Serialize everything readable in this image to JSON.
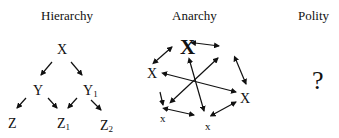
{
  "panels": [
    {
      "title": "Hierarchy",
      "nodes": {
        "x": "X",
        "y": "Y",
        "y1_base": "Y",
        "y1_sub": "1",
        "z": "Z",
        "z1_base": "Z",
        "z1_sub": "1",
        "z2_base": "Z",
        "z2_sub": "2"
      }
    },
    {
      "title": "Anarchy",
      "nodes": {
        "big_x": "X",
        "left_x": "X",
        "right_x": "X",
        "bottom_left_x": "x",
        "bottom_x": "x"
      }
    },
    {
      "title": "Polity",
      "symbol": "?"
    }
  ]
}
